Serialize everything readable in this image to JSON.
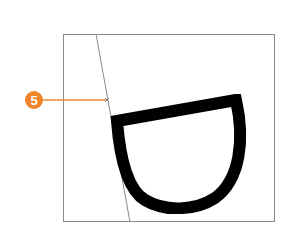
{
  "diagram": {
    "frame": {
      "x": 63,
      "y": 34,
      "width": 212,
      "height": 188,
      "stroke": "#8a8a8a"
    },
    "guide_line": {
      "x1": 96,
      "y1": 34,
      "x2": 130,
      "y2": 222,
      "stroke": "#8a8a8a"
    },
    "shape": {
      "description": "Pixelated D-shaped stroke (half-bowl) drawn with thick black brush",
      "stroke": "#000000",
      "stroke_width": 12
    },
    "callout": {
      "number": "5",
      "color": "#f0842b",
      "line_end": {
        "x": 107,
        "y": 100
      }
    }
  }
}
